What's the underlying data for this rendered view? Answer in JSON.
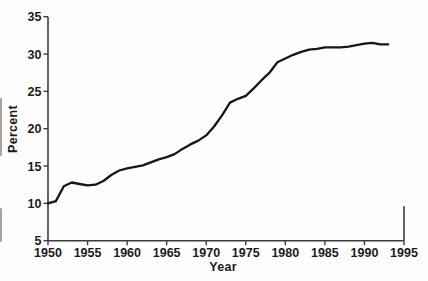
{
  "figure": {
    "background": "#fefefe",
    "axis_color": "#3c3c3c",
    "text_color": "#1b1b1b"
  },
  "chart_data": {
    "type": "line",
    "title": "",
    "xlabel": "Year",
    "ylabel": "Percent",
    "xlim": [
      1950,
      1995
    ],
    "ylim": [
      5,
      35
    ],
    "grid": false,
    "legend": null,
    "x_ticks": [
      1950,
      1955,
      1960,
      1965,
      1970,
      1975,
      1980,
      1985,
      1990,
      1995
    ],
    "x_tick_labels": [
      "1950",
      "1955",
      "1960",
      "1965",
      "1970",
      "1975",
      "1980",
      "1985",
      "1990",
      "1995"
    ],
    "y_ticks": [
      5,
      10,
      15,
      20,
      25,
      30,
      35
    ],
    "y_tick_labels": [
      "5",
      "10",
      "15",
      "20",
      "25",
      "30",
      "35"
    ],
    "series": [
      {
        "name": "Percent",
        "color": "#161616",
        "x": [
          1950,
          1951,
          1952,
          1953,
          1954,
          1955,
          1956,
          1957,
          1958,
          1959,
          1960,
          1961,
          1962,
          1963,
          1964,
          1965,
          1966,
          1967,
          1968,
          1969,
          1970,
          1971,
          1972,
          1973,
          1974,
          1975,
          1976,
          1977,
          1978,
          1979,
          1980,
          1981,
          1982,
          1983,
          1984,
          1985,
          1986,
          1987,
          1988,
          1989,
          1990,
          1991,
          1992,
          1993
        ],
        "y": [
          10.0,
          10.3,
          12.3,
          12.8,
          12.6,
          12.4,
          12.5,
          13.0,
          13.8,
          14.4,
          14.7,
          14.9,
          15.1,
          15.5,
          15.9,
          16.2,
          16.6,
          17.3,
          17.9,
          18.4,
          19.1,
          20.3,
          21.8,
          23.5,
          24.0,
          24.4,
          25.4,
          26.5,
          27.5,
          28.9,
          29.4,
          29.9,
          30.3,
          30.6,
          30.7,
          30.9,
          30.9,
          30.9,
          31.0,
          31.2,
          31.4,
          31.5,
          31.3,
          31.3
        ]
      }
    ],
    "partial_right_axis": {
      "x": 1995,
      "y_from": 5,
      "y_to": 9.6
    }
  }
}
